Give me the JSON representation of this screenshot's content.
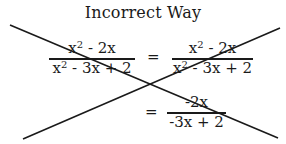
{
  "title": "Incorrect Way",
  "equation": {
    "step1": {
      "numerator": {
        "base": "x",
        "exp": "2",
        "rest": " - 2x"
      },
      "denominator": {
        "base": "x",
        "exp": "2",
        "rest": " - 3x + 2"
      }
    },
    "equals_1": "=",
    "step2": {
      "numerator": {
        "base": "x",
        "exp": "2",
        "rest": " - 2x"
      },
      "denominator": {
        "base": "x",
        "exp": "2",
        "rest": " - 3x + 2"
      }
    },
    "equals_2": "=",
    "step3": {
      "numerator": "-2x",
      "denominator": "-3x + 2"
    }
  },
  "cross_mark": {
    "meaning": "incorrect",
    "stroke_color": "#1a1a1a",
    "line1": {
      "x1": 10,
      "y1": 25,
      "x2": 278,
      "y2": 138
    },
    "line2": {
      "x1": 23,
      "y1": 139,
      "x2": 280,
      "y2": 28
    }
  }
}
